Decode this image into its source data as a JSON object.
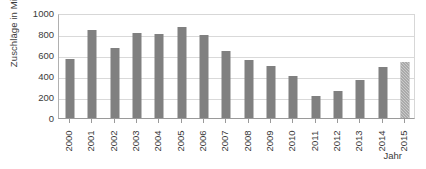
{
  "chart_data": {
    "type": "bar",
    "title": "",
    "subtitle": "",
    "xlabel": "Jahr",
    "ylabel": "Zuschläge in Mio. €",
    "categories": [
      "2000",
      "2001",
      "2002",
      "2003",
      "2004",
      "2005",
      "2006",
      "2007",
      "2008",
      "2009",
      "2010",
      "2011",
      "2012",
      "2013",
      "2014",
      "2015"
    ],
    "values": [
      560,
      840,
      670,
      805,
      800,
      865,
      790,
      640,
      550,
      500,
      400,
      210,
      260,
      360,
      490,
      530
    ],
    "series": [
      {
        "name": "Zuschläge",
        "values": [
          560,
          840,
          670,
          805,
          800,
          865,
          790,
          640,
          550,
          500,
          400,
          210,
          260,
          360,
          490,
          530
        ]
      }
    ],
    "ylim": [
      0,
      1000
    ],
    "y_ticks": [
      0,
      200,
      400,
      600,
      800,
      1000
    ],
    "y_tick_labels": [
      "0",
      "200",
      "400",
      "600",
      "800",
      "1000"
    ],
    "grid": true,
    "grid_axis": "y",
    "legend": false,
    "legend_position": "none",
    "bar_color": "#808080",
    "forecast_bar_color": "#8a8a8a",
    "forecast_categories": [
      "2015"
    ],
    "axis_color": "#9a9a9a",
    "gridline_color": "#d9d9d9",
    "text_color": "#3a3a3a",
    "background_color": "#ffffff",
    "x_tick_label_rotation": -90,
    "annotations": []
  }
}
